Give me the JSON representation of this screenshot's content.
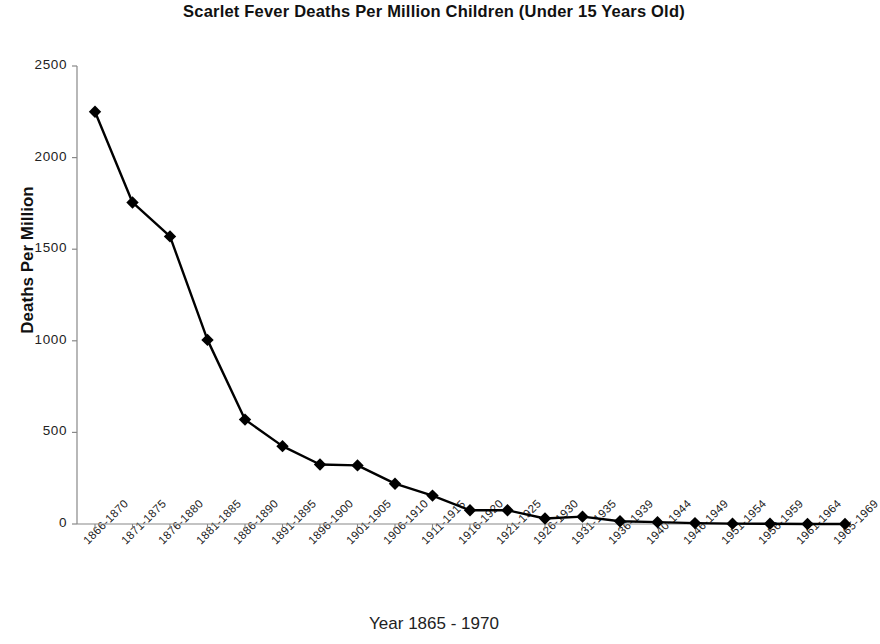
{
  "chart_data": {
    "type": "line",
    "title": "Scarlet Fever Deaths Per Million Children (Under 15 Years Old)",
    "xlabel": "Year 1865 - 1970",
    "ylabel": "Deaths Per Million",
    "ylim": [
      0,
      2500
    ],
    "yticks": [
      0,
      500,
      1000,
      1500,
      2000,
      2500
    ],
    "ytick_labels": [
      "0",
      "500",
      "1000",
      "1500",
      "2000",
      "2500"
    ],
    "grid": false,
    "legend": "none",
    "marker": "diamond",
    "line_color": "#000000",
    "marker_color": "#000000",
    "background_color": "#ffffff",
    "categories": [
      "1866-1870",
      "1871-1875",
      "1876-1880",
      "1881-1885",
      "1886-1890",
      "1891-1895",
      "1896-1900",
      "1901-1905",
      "1906-1910",
      "1911-1915",
      "1916-1920",
      "1921-1925",
      "1926-1930",
      "1931-1935",
      "1936-1939",
      "1940-1944",
      "1946-1949",
      "1951-1954",
      "1956-1959",
      "1961-1964",
      "1965-1969"
    ],
    "values": [
      2250,
      1755,
      1570,
      1005,
      570,
      425,
      325,
      320,
      220,
      155,
      75,
      75,
      30,
      40,
      15,
      10,
      5,
      2,
      1,
      0,
      0
    ],
    "series": [
      {
        "name": "Scarlet Fever Deaths Per Million",
        "values": [
          2250,
          1755,
          1570,
          1005,
          570,
          425,
          325,
          320,
          220,
          155,
          75,
          75,
          30,
          40,
          15,
          10,
          5,
          2,
          1,
          0,
          0
        ]
      }
    ]
  }
}
